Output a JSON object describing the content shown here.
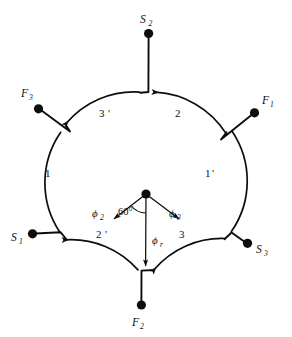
{
  "figure": {
    "background_color": "#ffffff",
    "ink_color": "#0d0d0d",
    "width": 292,
    "height": 337
  },
  "terminals": [
    {
      "id": "s2",
      "label": "S",
      "sub": "2",
      "position": "top",
      "dot_x": 148,
      "dot_y": 33,
      "label_x": 143,
      "label_y": 22
    },
    {
      "id": "f3",
      "label": "F",
      "sub": "3",
      "position": "upper-left",
      "dot_x": 38,
      "dot_y": 108,
      "label_x": 23,
      "label_y": 97
    },
    {
      "id": "f1",
      "label": "F",
      "sub": "1",
      "position": "upper-right",
      "dot_x": 255,
      "dot_y": 113,
      "label_x": 263,
      "label_y": 104
    },
    {
      "id": "s1",
      "label": "S",
      "sub": "1",
      "position": "lower-left",
      "dot_x": 32,
      "dot_y": 234,
      "label_x": 13,
      "label_y": 240
    },
    {
      "id": "s3",
      "label": "S",
      "sub": "3",
      "position": "lower-right",
      "dot_x": 248,
      "dot_y": 243,
      "label_x": 256,
      "label_y": 252
    },
    {
      "id": "f2",
      "label": "F",
      "sub": "2",
      "position": "bottom",
      "dot_x": 141,
      "dot_y": 305,
      "label_x": 134,
      "label_y": 325
    }
  ],
  "segments": [
    {
      "id": "seg-1",
      "label": "1",
      "prime": "",
      "position": "left",
      "label_x": 48,
      "label_y": 176
    },
    {
      "id": "seg-3-prime",
      "label": "3",
      "prime": "'",
      "position": "upper-left",
      "label_x": 103,
      "label_y": 116
    },
    {
      "id": "seg-2",
      "label": "2",
      "prime": "",
      "position": "upper-right",
      "label_x": 178,
      "label_y": 116
    },
    {
      "id": "seg-1-prime",
      "label": "1",
      "prime": "'",
      "position": "right",
      "label_x": 208,
      "label_y": 176
    },
    {
      "id": "seg-3",
      "label": "3",
      "prime": "",
      "position": "lower-right",
      "label_x": 182,
      "label_y": 237
    },
    {
      "id": "seg-2-prime",
      "label": "2",
      "prime": "'",
      "position": "lower-left",
      "label_x": 100,
      "label_y": 237
    }
  ],
  "phasors": [
    {
      "id": "phi-2",
      "label": "ϕ",
      "sub": "2",
      "direction": "down-left",
      "label_x": 95,
      "label_y": 216,
      "angle_deg": 240
    },
    {
      "id": "phi-r",
      "label": "ϕ",
      "sub": "r",
      "direction": "down",
      "label_x": 155,
      "label_y": 243,
      "angle_deg": 270
    },
    {
      "id": "phi-3",
      "label": "ϕ",
      "sub": "3",
      "direction": "down-right",
      "label_x": 172,
      "label_y": 216,
      "angle_deg": 300
    }
  ],
  "annotations": {
    "angle_label": "60°",
    "angle_x": 120,
    "angle_y": 214
  },
  "geometry": {
    "center_x": 146,
    "center_y": 181,
    "radius": 89,
    "hub_x": 146,
    "hub_y": 194
  }
}
